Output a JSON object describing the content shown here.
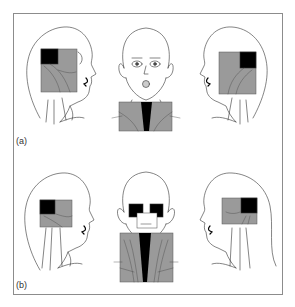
{
  "figure": {
    "panels": [
      {
        "label": "(a)",
        "views": [
          "left-lateral",
          "anterior",
          "right-lateral"
        ],
        "description": "Shaded regions on head and neck views"
      },
      {
        "label": "(b)",
        "views": [
          "left-lateral",
          "anterior",
          "right-lateral"
        ],
        "description": "Shaded regions on head and neck views"
      }
    ],
    "colors": {
      "line": "#333333",
      "shade": "#9a9a9a",
      "dark": "#000000",
      "frame": "#8c8c8c",
      "background": "#ffffff"
    }
  }
}
